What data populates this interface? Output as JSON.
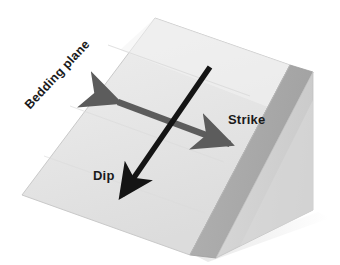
{
  "figure": {
    "background_color": "#ffffff"
  },
  "labels": {
    "bedding_plane": "Bedding plane",
    "strike": "Strike",
    "dip": "Dip"
  },
  "colors": {
    "top_face": "#e9e9e9",
    "top_face_shade": "#dedede",
    "slant_face": "#a9a9a9",
    "right_face": "#d2d2d2",
    "edge_line": "#bfbfbf",
    "strike_arrow": "#5c5c5c",
    "dip_arrow": "#141414",
    "shadow": "#ececec",
    "text": "#1a1a1a"
  },
  "geometry": {
    "block_apex": [
      155,
      18
    ],
    "block_left_corner": [
      22,
      195
    ],
    "block_bottom_front": [
      190,
      255
    ],
    "block_right_top": [
      290,
      65
    ],
    "block_right_bottom": [
      313,
      210
    ],
    "strike_arrow_start": [
      110,
      98
    ],
    "strike_arrow_end": [
      238,
      148
    ],
    "dip_arrow_start": [
      210,
      67
    ],
    "dip_arrow_end": [
      114,
      203
    ]
  }
}
